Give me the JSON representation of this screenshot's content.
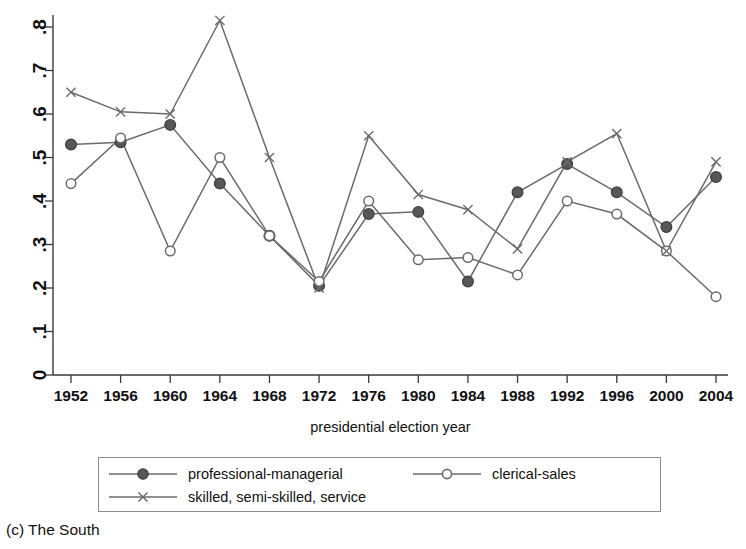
{
  "caption": "(c) The South",
  "chart_data": {
    "type": "line",
    "title": "",
    "subtitle": "",
    "xlabel": "presidential election year",
    "ylabel": "",
    "categories": [
      1952,
      1956,
      1960,
      1964,
      1968,
      1972,
      1976,
      1980,
      1984,
      1988,
      1992,
      1996,
      2000,
      2004
    ],
    "x": [
      1952,
      1956,
      1960,
      1964,
      1968,
      1972,
      1976,
      1980,
      1984,
      1988,
      1992,
      1996,
      2000,
      2004
    ],
    "xlim": [
      1952,
      2004
    ],
    "ylim": [
      0,
      0.8
    ],
    "yticks": [
      0,
      0.1,
      0.2,
      0.3,
      0.4,
      0.5,
      0.6,
      0.7,
      0.8
    ],
    "ytick_labels": [
      "0",
      ".1",
      ".2",
      ".3",
      ".4",
      ".5",
      ".6",
      ".7",
      ".8"
    ],
    "xtick_labels": [
      "1952",
      "1956",
      "1960",
      "1964",
      "1968",
      "1972",
      "1976",
      "1980",
      "1984",
      "1988",
      "1992",
      "1996",
      "2000",
      "2004"
    ],
    "grid": false,
    "legend_position": "below",
    "series": [
      {
        "name": "professional-managerial",
        "marker": "filled-circle",
        "color": "#575757",
        "values": [
          0.53,
          0.535,
          0.575,
          0.44,
          0.32,
          0.205,
          0.37,
          0.375,
          0.215,
          0.42,
          0.485,
          0.42,
          0.34,
          0.455
        ]
      },
      {
        "name": "clerical-sales",
        "marker": "open-circle",
        "color": "#6b6b6b",
        "values": [
          0.44,
          0.545,
          0.285,
          0.5,
          0.32,
          0.215,
          0.4,
          0.265,
          0.27,
          0.23,
          0.4,
          0.37,
          0.285,
          0.18
        ]
      },
      {
        "name": "skilled, semi-skilled, service",
        "marker": "x",
        "color": "#6b6b6b",
        "values": [
          0.65,
          0.605,
          0.6,
          0.815,
          0.5,
          0.2,
          0.55,
          0.415,
          0.38,
          0.29,
          0.49,
          0.555,
          0.285,
          0.49
        ]
      }
    ]
  },
  "legend": {
    "items": [
      {
        "label": "professional-managerial",
        "marker": "filled-circle"
      },
      {
        "label": "clerical-sales",
        "marker": "open-circle"
      },
      {
        "label": "skilled, semi-skilled, service",
        "marker": "x"
      }
    ]
  }
}
